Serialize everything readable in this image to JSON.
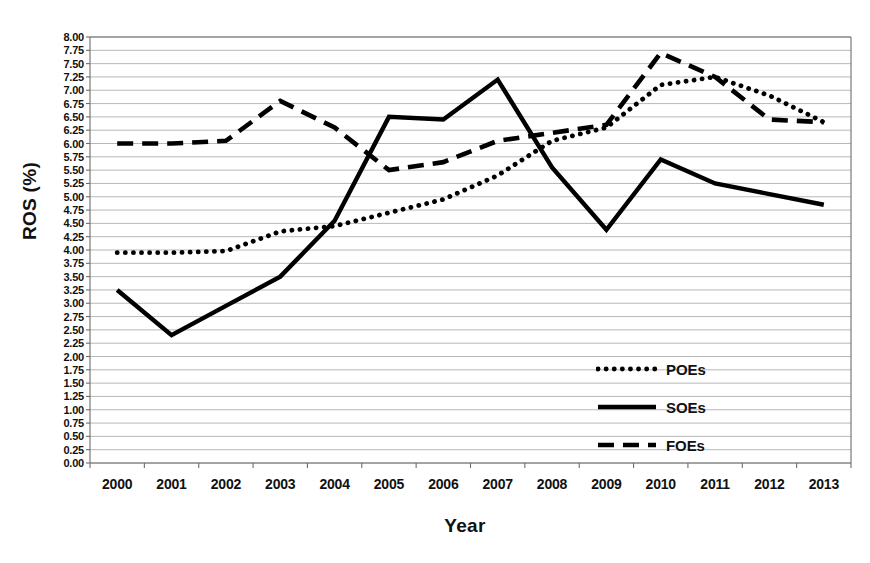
{
  "chart_data": {
    "type": "line",
    "title": "",
    "xlabel": "Year",
    "ylabel": "ROS (%)",
    "categories": [
      "2000",
      "2001",
      "2002",
      "2003",
      "2004",
      "2005",
      "2006",
      "2007",
      "2008",
      "2009",
      "2010",
      "2011",
      "2012",
      "2013"
    ],
    "ylim": [
      0.0,
      8.0
    ],
    "ytick_step": 0.25,
    "grid": true,
    "legend_position": "inside-right",
    "ytick_labels": [
      "8.00",
      "7.75",
      "7.50",
      "7.25",
      "7.00",
      "6.75",
      "6.50",
      "6.25",
      "6.00",
      "5.75",
      "5.50",
      "5.25",
      "5.00",
      "4.75",
      "4.50",
      "4.25",
      "4.00",
      "3.75",
      "3.50",
      "3.25",
      "3.00",
      "2.75",
      "2.50",
      "2.25",
      "2.00",
      "1.75",
      "1.50",
      "1.25",
      "1.00",
      "0.75",
      "0.50",
      "0.25",
      "0.00"
    ],
    "series": [
      {
        "name": "POEs",
        "style": "dotted",
        "values": [
          3.95,
          3.95,
          3.98,
          4.35,
          4.45,
          4.7,
          4.95,
          5.4,
          6.05,
          6.3,
          7.1,
          7.25,
          6.9,
          6.4
        ]
      },
      {
        "name": "SOEs",
        "style": "solid",
        "values": [
          3.25,
          2.4,
          2.95,
          3.5,
          4.55,
          6.5,
          6.45,
          7.2,
          5.55,
          4.38,
          5.7,
          5.25,
          5.05,
          4.85
        ]
      },
      {
        "name": "FOEs",
        "style": "dashed",
        "values": [
          6.0,
          6.0,
          6.05,
          6.8,
          6.3,
          5.5,
          5.65,
          6.05,
          6.2,
          6.35,
          7.7,
          7.25,
          6.45,
          6.4
        ]
      }
    ]
  },
  "legend": {
    "items": [
      {
        "label": "POEs",
        "style": "dotted"
      },
      {
        "label": "SOEs",
        "style": "solid"
      },
      {
        "label": "FOEs",
        "style": "dashed"
      }
    ]
  },
  "colors": {
    "series_color": "#000000",
    "grid_color": "#b0b0b0",
    "axis_color": "#6d6d6d",
    "text_color": "#111111",
    "background": "#ffffff"
  }
}
